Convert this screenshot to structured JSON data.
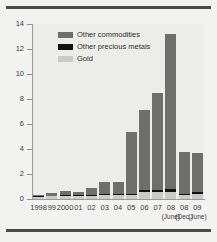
{
  "chart_data": {
    "type": "bar",
    "stacked": true,
    "title": "",
    "xlabel": "",
    "ylabel": "",
    "ylim": [
      0,
      14
    ],
    "yticks": [
      0,
      2,
      4,
      6,
      8,
      10,
      12,
      14
    ],
    "grid": false,
    "legend_position": "top-left",
    "categories": [
      "1998",
      "99",
      "2000",
      "01",
      "02",
      "03",
      "04",
      "05",
      "06",
      "07",
      "08",
      "08",
      "09"
    ],
    "category_sublabels": [
      "",
      "",
      "",
      "",
      "",
      "",
      "",
      "",
      "",
      "",
      "(June)",
      "(Dec.)",
      "(June)"
    ],
    "series": [
      {
        "name": "Gold",
        "color": "#c9c9c6",
        "values": [
          0.2,
          0.25,
          0.3,
          0.3,
          0.3,
          0.35,
          0.35,
          0.35,
          0.6,
          0.6,
          0.6,
          0.3,
          0.4
        ]
      },
      {
        "name": "Other precious metals",
        "color": "#121212",
        "values": [
          0.03,
          0.03,
          0.04,
          0.04,
          0.05,
          0.05,
          0.05,
          0.08,
          0.12,
          0.15,
          0.2,
          0.12,
          0.15
        ]
      },
      {
        "name": "Other commodities",
        "color": "#6e6e6c",
        "values": [
          0.12,
          0.17,
          0.31,
          0.26,
          0.55,
          1.0,
          1.0,
          4.97,
          6.38,
          7.75,
          12.4,
          3.38,
          3.15
        ]
      }
    ],
    "totals": [
      0.35,
      0.45,
      0.65,
      0.6,
      0.9,
      1.4,
      1.4,
      5.4,
      7.1,
      8.5,
      13.2,
      3.8,
      3.7
    ]
  },
  "legend": {
    "items": [
      {
        "label": "Other commodities",
        "key": "commodities"
      },
      {
        "label": "Other precious metals",
        "key": "precious"
      },
      {
        "label": "Gold",
        "key": "gold"
      }
    ]
  }
}
